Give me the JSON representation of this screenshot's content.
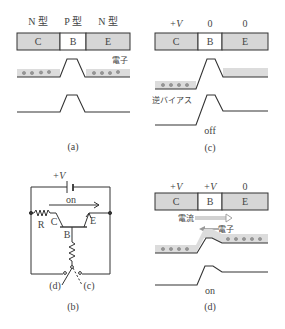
{
  "colors": {
    "region_fill": "#d6d6d6",
    "base_fill": "#ffffff",
    "band_fill": "#dcdcdc",
    "line": "#333333",
    "electron": "#888888",
    "arrow_gray": "#999999"
  },
  "panel_a": {
    "caption": "(a)",
    "type_labels": [
      "N 型",
      "P 型",
      "N 型"
    ],
    "regions": [
      "C",
      "B",
      "E"
    ],
    "electron_label": "電子"
  },
  "panel_c": {
    "caption": "(c)",
    "voltage_labels": [
      "+V",
      "0",
      "0"
    ],
    "regions": [
      "C",
      "B",
      "E"
    ],
    "bias_label": "逆バイアス",
    "state": "off"
  },
  "panel_b": {
    "caption": "(b)",
    "supply_label": "+V",
    "current_label": "on",
    "resistor_label": "R",
    "collector_label": "C",
    "base_label": "B",
    "emitter_label": "E",
    "switch_left": "(d)",
    "switch_right": "(c)"
  },
  "panel_d": {
    "caption": "(d)",
    "voltage_labels": [
      "+V",
      "+V",
      "0"
    ],
    "regions": [
      "C",
      "B",
      "E"
    ],
    "current_label": "電流",
    "electron_label": "電子",
    "state": "on"
  }
}
